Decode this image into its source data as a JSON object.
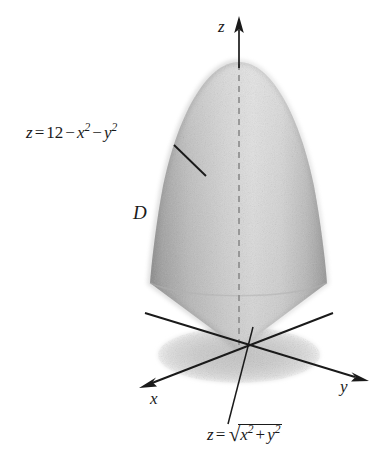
{
  "figure": {
    "kind": "3d-solid-region-diagram",
    "region_label": "D",
    "background_color": "#ffffff",
    "ink_color": "#1a1a1a"
  },
  "axes": {
    "x": {
      "label": "x",
      "direction": "down-left"
    },
    "y": {
      "label": "y",
      "direction": "right-down"
    },
    "z": {
      "label": "z",
      "direction": "up"
    },
    "origin": {
      "x": 239,
      "y": 349
    }
  },
  "equations": {
    "paraboloid": {
      "lhs": "z",
      "equals": "=",
      "constant": "12",
      "minus_1": "−",
      "term_x": "x",
      "exp_x": "2",
      "minus_2": "−",
      "term_y": "y",
      "exp_y": "2",
      "plain": "z = 12 − x² − y²"
    },
    "cone": {
      "lhs": "z",
      "equals": "=",
      "radical": "√",
      "term_x": "x",
      "exp_x": "2",
      "plus": "+",
      "term_y": "y",
      "exp_y": "2",
      "plain": "z = √(x² + y²)"
    }
  },
  "surface": {
    "apex_top": {
      "x": 239,
      "y": 62
    },
    "widest_point": {
      "x_left": 150,
      "x_right": 327,
      "y": 283
    },
    "cone_apex": {
      "x": 239,
      "y": 349
    },
    "shadow_ellipse": {
      "cx": 239,
      "cy": 355,
      "rx": 81,
      "ry": 28
    },
    "center_axis_dashed": true,
    "shading": "stippled gray, darker at left and right silhouette edges"
  },
  "colors": {
    "solid_light": "#dcdcdc",
    "solid_mid": "#bdbdbd",
    "solid_dark": "#9a9a9a",
    "shadow": "#cfcfcf",
    "line": "#1a1a1a",
    "dashed": "#8a8a8a"
  }
}
